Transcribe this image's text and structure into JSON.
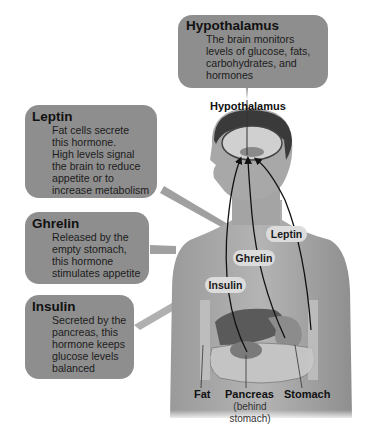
{
  "callouts": {
    "hypothalamus": {
      "title": "Hypothalamus",
      "body": "The brain monitors\nlevels of glucose, fats,\ncarbohydrates, and\nhormones"
    },
    "leptin": {
      "title": "Leptin",
      "body": "Fat cells secrete\nthis hormone.\nHigh levels signal\nthe brain to reduce\nappetite or to\nincrease metabolism"
    },
    "ghrelin": {
      "title": "Ghrelin",
      "body": "Released by the\nempty stomach,\nthis hormone\nstimulates appetite"
    },
    "insulin": {
      "title": "Insulin",
      "body": "Secreted by the\npancreas, this\nhormone keeps\nglucose levels\nbalanced"
    }
  },
  "anatomy_labels": {
    "hypothalamus": "Hypothalamus",
    "fat": "Fat",
    "pancreas": "Pancreas",
    "pancreas_note": "(behind\nstomach)",
    "stomach": "Stomach"
  },
  "pathway_pills": {
    "leptin": "Leptin",
    "ghrelin": "Ghrelin",
    "insulin": "Insulin"
  },
  "colors": {
    "callout_fill": "#8e8e8e",
    "pill_fill": "#dcdcdc",
    "body_gray": "#a9a9a9",
    "arrow": "#111111"
  }
}
